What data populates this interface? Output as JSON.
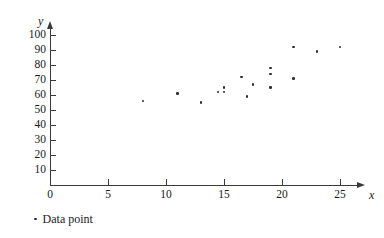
{
  "chart_data": {
    "type": "scatter",
    "title": "",
    "xlabel": "x",
    "ylabel": "y",
    "xlim": [
      0,
      26.5
    ],
    "ylim": [
      0,
      105
    ],
    "grid": false,
    "legend_position": "below-left",
    "x_ticks": [
      0,
      5,
      10,
      15,
      20,
      25
    ],
    "x_tick_labels": [
      "0",
      "5",
      "10",
      "15",
      "20",
      "25"
    ],
    "y_ticks": [
      10,
      20,
      30,
      40,
      50,
      60,
      70,
      80,
      90,
      100
    ],
    "y_tick_labels": [
      "10",
      "20",
      "30",
      "40",
      "50",
      "60",
      "70",
      "80",
      "90",
      "100"
    ],
    "series": [
      {
        "name": "Data point",
        "marker": "dot",
        "color": "#2b2b3a",
        "points": [
          {
            "x": 8,
            "y": 56
          },
          {
            "x": 11,
            "y": 61
          },
          {
            "x": 13,
            "y": 55
          },
          {
            "x": 14.5,
            "y": 62
          },
          {
            "x": 15,
            "y": 65
          },
          {
            "x": 15,
            "y": 62
          },
          {
            "x": 16.5,
            "y": 72
          },
          {
            "x": 17,
            "y": 59
          },
          {
            "x": 17.5,
            "y": 67
          },
          {
            "x": 19,
            "y": 78
          },
          {
            "x": 19,
            "y": 74
          },
          {
            "x": 19,
            "y": 65
          },
          {
            "x": 21,
            "y": 92
          },
          {
            "x": 21,
            "y": 71
          },
          {
            "x": 23,
            "y": 89
          },
          {
            "x": 25,
            "y": 92
          }
        ]
      }
    ]
  },
  "legend": {
    "entries": [
      {
        "label": "Data point"
      }
    ]
  },
  "geometry": {
    "origin_x_px": 50,
    "origin_y_px": 185,
    "px_per_x_unit": 11.6,
    "px_per_y_unit": 1.5
  }
}
